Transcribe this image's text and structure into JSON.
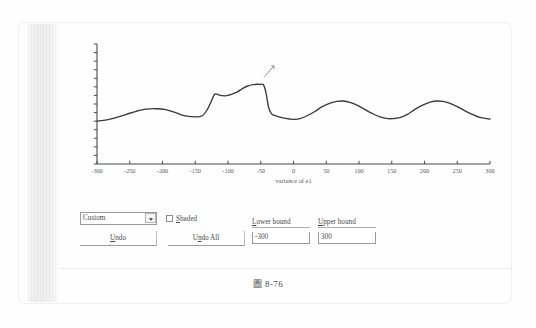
{
  "figure": {
    "caption": "圖 8-76"
  },
  "chart_data": {
    "type": "line",
    "title": "",
    "xlabel": "variance of e1",
    "ylabel": "",
    "xlim": [
      -300,
      300
    ],
    "ylim": [
      0,
      14
    ],
    "grid": false,
    "legend": "none",
    "x_ticks": [
      -300,
      -250,
      -200,
      -150,
      -100,
      -50,
      0,
      50,
      100,
      150,
      200,
      250,
      300
    ],
    "x_tick_labels": [
      "-300",
      "-250",
      "-200",
      "-150",
      "-100",
      "-50",
      "0",
      "50",
      "100",
      "150",
      "200",
      "250",
      "300"
    ],
    "y_ticks_count": 15,
    "y_tick_labels": [],
    "series": [
      {
        "name": "variance of e1",
        "x": [
          -300,
          -285,
          -270,
          -255,
          -240,
          -225,
          -210,
          -195,
          -180,
          -170,
          -160,
          -150,
          -140,
          -132,
          -125,
          -120,
          -112,
          -105,
          -98,
          -92,
          -85,
          -78,
          -70,
          -62,
          -55,
          -50,
          -46,
          -42,
          -38,
          -34,
          -30,
          -22,
          -14,
          -6,
          2,
          10,
          20,
          32,
          44,
          56,
          66,
          76,
          86,
          96,
          108,
          120,
          132,
          144,
          152,
          162,
          174,
          186,
          198,
          210,
          220,
          228,
          238,
          250,
          262,
          274,
          286,
          300
        ],
        "y": [
          5.0,
          5.15,
          5.45,
          5.8,
          6.15,
          6.4,
          6.45,
          6.35,
          6.0,
          5.7,
          5.55,
          5.5,
          5.6,
          6.3,
          7.4,
          8.15,
          8.0,
          7.95,
          8.05,
          8.2,
          8.45,
          8.8,
          9.1,
          9.25,
          9.3,
          9.28,
          9.25,
          8.3,
          6.6,
          5.9,
          5.7,
          5.5,
          5.35,
          5.25,
          5.2,
          5.3,
          5.6,
          6.1,
          6.7,
          7.1,
          7.3,
          7.35,
          7.2,
          6.9,
          6.4,
          5.9,
          5.5,
          5.3,
          5.3,
          5.4,
          5.8,
          6.4,
          6.9,
          7.25,
          7.35,
          7.3,
          7.1,
          6.7,
          6.2,
          5.75,
          5.4,
          5.25
        ]
      }
    ],
    "annotations": [
      {
        "name": "mouse-cursor",
        "x": -42,
        "y": 10.4
      }
    ],
    "colors": {
      "line": "#3a3a3a",
      "axis": "#4a4a4a"
    }
  },
  "controls": {
    "mode_select": {
      "value": "Custom",
      "options": [
        "Custom"
      ]
    },
    "shaded_checkbox": {
      "label_prefix": "",
      "label_accel": "S",
      "label_rest": "haded",
      "checked": false
    },
    "undo_button": {
      "accel": "U",
      "rest": "ndo"
    },
    "undo_all_button": {
      "prefix": "U",
      "accel": "n",
      "rest": "do All"
    },
    "lower_bound": {
      "accel": "L",
      "label_rest": "ower bound",
      "value": "-300"
    },
    "upper_bound": {
      "accel": "U",
      "label_rest": "pper bound",
      "value": "300"
    }
  }
}
